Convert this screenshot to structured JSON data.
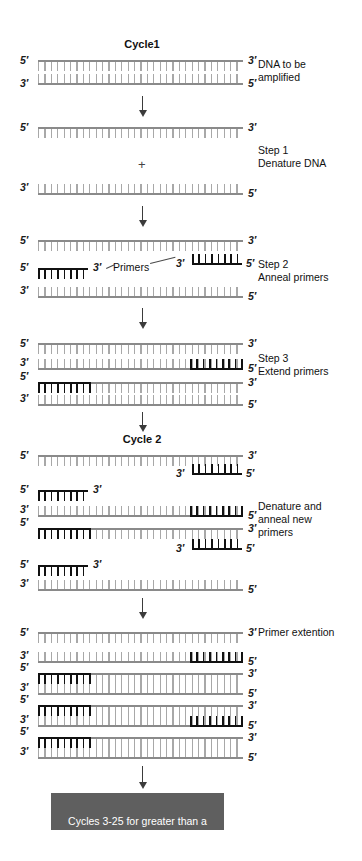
{
  "figure": {
    "title_cycle1": "Cycle1",
    "title_cycle2": "Cycle 2",
    "plus_symbol": "+",
    "primers_label": "Primers",
    "five_prime": "5′",
    "three_prime": "3′"
  },
  "captions": [
    {
      "id": "dna-to-be-amplified",
      "text": "DNA to be\namplified"
    },
    {
      "id": "step-1",
      "text": "Step 1\nDenature DNA"
    },
    {
      "id": "step-2",
      "text": "Step 2\nAnneal primers"
    },
    {
      "id": "step-3",
      "text": "Step 3\nExtend primers"
    },
    {
      "id": "denature-anneal-new-primers",
      "text": "Denature and\nanneal new\nprimers"
    },
    {
      "id": "primer-extention",
      "text": "Primer extention"
    }
  ],
  "result": {
    "line1": "Cycles 3-25 for greater than a",
    "line2_pre": "10",
    "line2_sup": "6",
    "line2_post": "-fold increase in DNA"
  },
  "colors": {
    "strand_gray": "#8a8a8a",
    "tick_gray": "#a8a8a8",
    "primer_dark": "#111111",
    "result_box_bg": "#5f5f5f",
    "result_box_text": "#ffffff",
    "arrow": "#3b3b3b"
  },
  "diagram": {
    "type": "pcr-schematic",
    "strand_left_x": 38,
    "strand_right_x": 243,
    "arrow_x": 142
  }
}
